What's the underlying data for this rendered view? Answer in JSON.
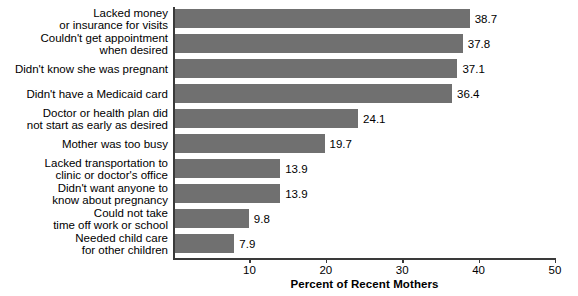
{
  "chart_data": {
    "type": "bar",
    "orientation": "horizontal",
    "title": "",
    "xlabel": "Percent of Recent Mothers",
    "ylabel": "",
    "xlim": [
      0,
      50
    ],
    "xticks": [
      10,
      20,
      30,
      40,
      50
    ],
    "xtick_labels": [
      "10",
      "20",
      "30",
      "40",
      "50"
    ],
    "grid": false,
    "legend": false,
    "bar_color": "#707070",
    "axis_color": "#3a3a3a",
    "categories": [
      "Lacked money\nor insurance for visits",
      "Couldn't get appointment\nwhen desired",
      "Didn't know she was pregnant",
      "Didn't have a Medicaid card",
      "Doctor or health plan did\nnot start as early as desired",
      "Mother was too busy",
      "Lacked transportation to\nclinic or doctor's office",
      "Didn't want anyone to\nknow about pregnancy",
      "Could not take\ntime off work or school",
      "Needed child care\nfor other children"
    ],
    "values": [
      38.7,
      37.8,
      37.1,
      36.4,
      24.1,
      19.7,
      13.9,
      13.9,
      9.8,
      7.9
    ],
    "value_labels": [
      "38.7",
      "37.8",
      "37.1",
      "36.4",
      "24.1",
      "19.7",
      "13.9",
      "13.9",
      "9.8",
      "7.9"
    ]
  }
}
